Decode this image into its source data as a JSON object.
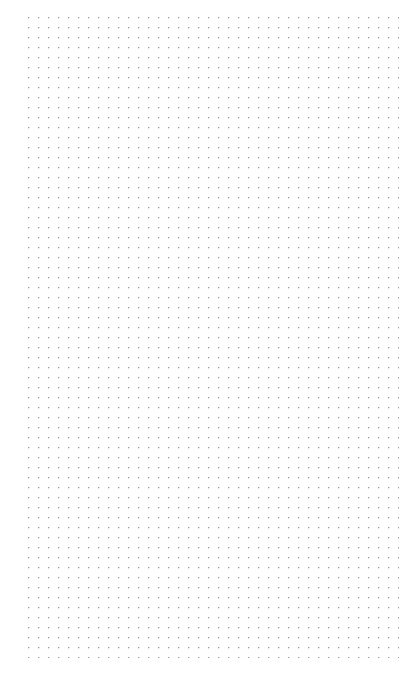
{
  "page": {
    "title": "Dot Grid Page",
    "width_px": 413,
    "height_px": 675,
    "background_color": "#ffffff",
    "content_text": ""
  },
  "dot_grid": {
    "name": "dot-grid",
    "dot_color": "#9a9a9a",
    "dot_diameter_px": 1.2,
    "spacing_x_px": 10,
    "spacing_y_px": 10,
    "origin_x_px": 28,
    "origin_y_px": 17,
    "region_width_px": 371,
    "region_height_px": 641,
    "columns": 38,
    "rows": 65,
    "margin_left_px": 28,
    "margin_top_px": 17,
    "margin_right_px": 14,
    "margin_bottom_px": 17
  },
  "chart_data": {
    "type": "scatter",
    "title": "",
    "xlabel": "",
    "ylabel": "",
    "xlim": [
      28,
      398
    ],
    "ylim": [
      17,
      657
    ],
    "grid": true,
    "legend": "none",
    "spacing": 10,
    "point_color": "#9a9a9a",
    "point_count": 2470
  }
}
